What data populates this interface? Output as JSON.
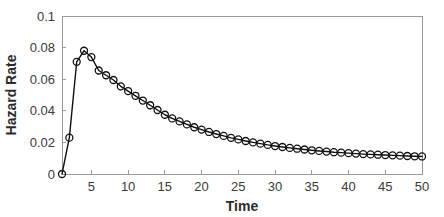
{
  "chart_data": {
    "type": "line",
    "title": "",
    "xlabel": "Time",
    "ylabel": "Hazard Rate",
    "xlim": [
      1,
      50
    ],
    "ylim": [
      0,
      0.1
    ],
    "grid": false,
    "legend": null,
    "marker": "open-circle",
    "line_color": "#111111",
    "xticks": [
      5,
      10,
      15,
      20,
      25,
      30,
      35,
      40,
      45,
      50
    ],
    "xtick_labels": [
      "5",
      "10",
      "15",
      "20",
      "25",
      "30",
      "35",
      "40",
      "45",
      "50"
    ],
    "yticks": [
      0,
      0.02,
      0.04,
      0.06,
      0.08,
      0.1
    ],
    "ytick_labels": [
      "0",
      "0.02",
      "0.04",
      "0.06",
      "0.08",
      "0.1"
    ],
    "x": [
      1,
      2,
      3,
      4,
      5,
      6,
      7,
      8,
      9,
      10,
      11,
      12,
      13,
      14,
      15,
      16,
      17,
      18,
      19,
      20,
      21,
      22,
      23,
      24,
      25,
      26,
      27,
      28,
      29,
      30,
      31,
      32,
      33,
      34,
      35,
      36,
      37,
      38,
      39,
      40,
      41,
      42,
      43,
      44,
      45,
      46,
      47,
      48,
      49,
      50
    ],
    "values": [
      0.0,
      0.023,
      0.071,
      0.078,
      0.074,
      0.0655,
      0.0625,
      0.0595,
      0.0555,
      0.0525,
      0.0495,
      0.0465,
      0.0435,
      0.0405,
      0.0375,
      0.0352,
      0.0333,
      0.0314,
      0.0296,
      0.0281,
      0.0266,
      0.0253,
      0.0241,
      0.0229,
      0.0219,
      0.0209,
      0.02,
      0.0192,
      0.0184,
      0.0177,
      0.0171,
      0.0165,
      0.016,
      0.0155,
      0.015,
      0.0146,
      0.0142,
      0.0138,
      0.0135,
      0.0132,
      0.0129,
      0.0126,
      0.0124,
      0.0122,
      0.012,
      0.0118,
      0.0116,
      0.0114,
      0.0112,
      0.0111
    ],
    "series": [
      {
        "name": "Hazard Rate",
        "values": [
          0.0,
          0.023,
          0.071,
          0.078,
          0.074,
          0.0655,
          0.0625,
          0.0595,
          0.0555,
          0.0525,
          0.0495,
          0.0465,
          0.0435,
          0.0405,
          0.0375,
          0.0352,
          0.0333,
          0.0314,
          0.0296,
          0.0281,
          0.0266,
          0.0253,
          0.0241,
          0.0229,
          0.0219,
          0.0209,
          0.02,
          0.0192,
          0.0184,
          0.0177,
          0.0171,
          0.0165,
          0.016,
          0.0155,
          0.015,
          0.0146,
          0.0142,
          0.0138,
          0.0135,
          0.0132,
          0.0129,
          0.0126,
          0.0124,
          0.0122,
          0.012,
          0.0118,
          0.0116,
          0.0114,
          0.0112,
          0.0111
        ]
      }
    ]
  },
  "axes": {
    "x_title": "Time",
    "y_title": "Hazard Rate"
  }
}
